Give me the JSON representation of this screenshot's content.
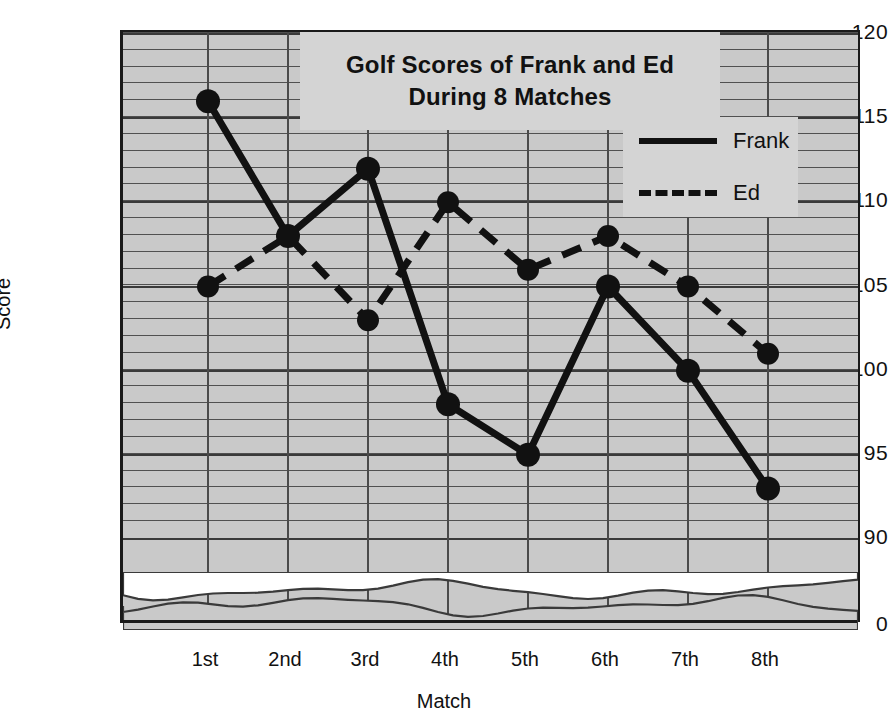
{
  "chart_data": {
    "type": "line",
    "title": "Golf Scores of Frank and Ed During 8 Matches",
    "title_line1": "Golf Scores of Frank and Ed",
    "title_line2": "During 8 Matches",
    "xlabel": "Match",
    "ylabel": "Score",
    "categories": [
      "1st",
      "2nd",
      "3rd",
      "4th",
      "5th",
      "6th",
      "7th",
      "8th"
    ],
    "ylim": [
      90,
      120
    ],
    "yticks": [
      120,
      115,
      110,
      105,
      100,
      95,
      90
    ],
    "ytick_labels": [
      "120",
      "115",
      "110",
      "105",
      "100",
      "95",
      "90"
    ],
    "axis_break_label": "0",
    "grid": true,
    "minor_grid_step": 1,
    "major_grid_step": 5,
    "legend_position": "upper right",
    "series": [
      {
        "name": "Frank",
        "style": "solid",
        "marker": "circle",
        "color": "#111111",
        "values": [
          116,
          108,
          112,
          98,
          95,
          105,
          100,
          93
        ]
      },
      {
        "name": "Ed",
        "style": "dashed",
        "marker": "circle",
        "color": "#111111",
        "values": [
          105,
          108,
          103,
          110,
          106,
          108,
          105,
          101
        ]
      }
    ]
  },
  "colors": {
    "plot_background": "#c9c9c9",
    "panel_background": "#d4d4d4",
    "ink": "#111111",
    "gridline": "#3a3a3a"
  }
}
